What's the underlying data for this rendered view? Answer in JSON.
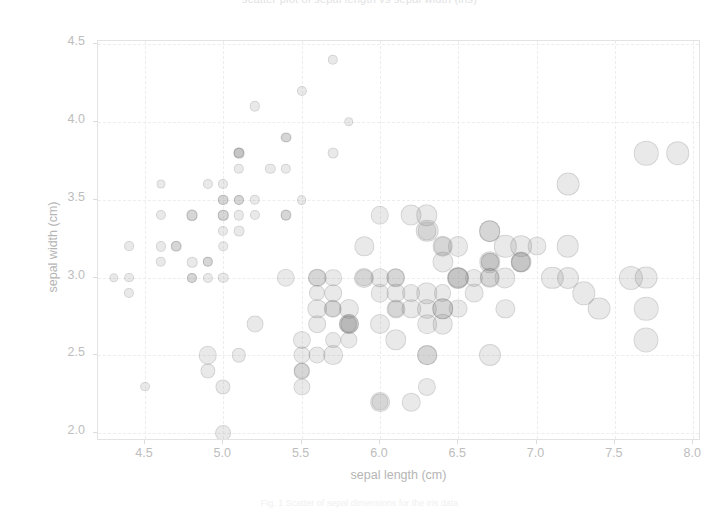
{
  "figure": {
    "title": "scatter plot of sepal length vs sepal width (iris)",
    "caption": "Fig. 1  Scatter of sepal dimensions for the iris data",
    "background": "#ffffff",
    "marker_color": "#787878",
    "grid_color": "#ededed",
    "axis_color": "#e3e3e3",
    "tick_text_color": "#bdbdbd"
  },
  "chart_data": {
    "type": "scatter",
    "title": "scatter plot of sepal length vs sepal width (iris)",
    "xlabel": "sepal length (cm)",
    "ylabel": "sepal width (cm)",
    "xlim": [
      4.2,
      8.05
    ],
    "ylim": [
      1.95,
      4.52
    ],
    "xticks": [
      4.5,
      5.0,
      5.5,
      6.0,
      6.5,
      7.0,
      7.5,
      8.0
    ],
    "yticks": [
      2.0,
      2.5,
      3.0,
      3.5,
      4.0,
      4.5
    ],
    "xtick_labels": [
      "4.5",
      "5.0",
      "5.5",
      "6.0",
      "6.5",
      "7.0",
      "7.5",
      "8.0"
    ],
    "ytick_labels": [
      "2.0",
      "2.5",
      "3.0",
      "3.5",
      "4.0",
      "4.5"
    ],
    "grid": true,
    "legend": false,
    "marker": "circle",
    "marker_alpha": 0.18,
    "size_encodes": "petal length (cm)",
    "n_points": 150,
    "points": [
      [
        5.1,
        3.5,
        1.4
      ],
      [
        4.9,
        3.0,
        1.4
      ],
      [
        4.7,
        3.2,
        1.3
      ],
      [
        4.6,
        3.1,
        1.5
      ],
      [
        5.0,
        3.6,
        1.4
      ],
      [
        5.4,
        3.9,
        1.7
      ],
      [
        4.6,
        3.4,
        1.4
      ],
      [
        5.0,
        3.4,
        1.5
      ],
      [
        4.4,
        2.9,
        1.4
      ],
      [
        4.9,
        3.1,
        1.5
      ],
      [
        5.4,
        3.7,
        1.5
      ],
      [
        4.8,
        3.4,
        1.6
      ],
      [
        4.8,
        3.0,
        1.4
      ],
      [
        4.3,
        3.0,
        1.1
      ],
      [
        5.8,
        4.0,
        1.2
      ],
      [
        5.7,
        4.4,
        1.5
      ],
      [
        5.4,
        3.9,
        1.3
      ],
      [
        5.1,
        3.5,
        1.4
      ],
      [
        5.7,
        3.8,
        1.7
      ],
      [
        5.1,
        3.8,
        1.5
      ],
      [
        5.4,
        3.4,
        1.7
      ],
      [
        5.1,
        3.7,
        1.5
      ],
      [
        4.6,
        3.6,
        1.0
      ],
      [
        5.1,
        3.3,
        1.7
      ],
      [
        4.8,
        3.4,
        1.9
      ],
      [
        5.0,
        3.0,
        1.6
      ],
      [
        5.0,
        3.4,
        1.6
      ],
      [
        5.2,
        3.5,
        1.5
      ],
      [
        5.2,
        3.4,
        1.4
      ],
      [
        4.7,
        3.2,
        1.6
      ],
      [
        4.8,
        3.1,
        1.6
      ],
      [
        5.4,
        3.4,
        1.5
      ],
      [
        5.2,
        4.1,
        1.5
      ],
      [
        5.5,
        4.2,
        1.4
      ],
      [
        4.9,
        3.1,
        1.5
      ],
      [
        5.0,
        3.2,
        1.2
      ],
      [
        5.5,
        3.5,
        1.3
      ],
      [
        4.9,
        3.6,
        1.4
      ],
      [
        4.4,
        3.0,
        1.3
      ],
      [
        5.1,
        3.4,
        1.5
      ],
      [
        5.0,
        3.5,
        1.3
      ],
      [
        4.5,
        2.3,
        1.3
      ],
      [
        4.4,
        3.2,
        1.3
      ],
      [
        5.0,
        3.5,
        1.6
      ],
      [
        5.1,
        3.8,
        1.9
      ],
      [
        4.8,
        3.0,
        1.4
      ],
      [
        5.1,
        3.8,
        1.6
      ],
      [
        4.6,
        3.2,
        1.4
      ],
      [
        5.3,
        3.7,
        1.5
      ],
      [
        5.0,
        3.3,
        1.4
      ],
      [
        7.0,
        3.2,
        4.7
      ],
      [
        6.4,
        3.2,
        4.5
      ],
      [
        6.9,
        3.1,
        4.9
      ],
      [
        5.5,
        2.3,
        4.0
      ],
      [
        6.5,
        2.8,
        4.6
      ],
      [
        5.7,
        2.8,
        4.5
      ],
      [
        6.3,
        3.3,
        4.7
      ],
      [
        4.9,
        2.4,
        3.3
      ],
      [
        6.6,
        2.9,
        4.6
      ],
      [
        5.2,
        2.7,
        3.9
      ],
      [
        5.0,
        2.0,
        3.5
      ],
      [
        5.9,
        3.0,
        4.2
      ],
      [
        6.0,
        2.2,
        4.0
      ],
      [
        6.1,
        2.9,
        4.7
      ],
      [
        5.6,
        2.9,
        3.6
      ],
      [
        6.7,
        3.1,
        4.4
      ],
      [
        5.6,
        3.0,
        4.5
      ],
      [
        5.8,
        2.7,
        4.1
      ],
      [
        6.2,
        2.2,
        4.5
      ],
      [
        5.6,
        2.5,
        3.9
      ],
      [
        5.9,
        3.2,
        4.8
      ],
      [
        6.1,
        2.8,
        4.0
      ],
      [
        6.3,
        2.5,
        4.9
      ],
      [
        6.1,
        2.8,
        4.7
      ],
      [
        6.4,
        2.9,
        4.3
      ],
      [
        6.6,
        3.0,
        4.4
      ],
      [
        6.8,
        2.8,
        4.8
      ],
      [
        6.7,
        3.0,
        5.0
      ],
      [
        6.0,
        2.9,
        4.5
      ],
      [
        5.7,
        2.6,
        3.5
      ],
      [
        5.5,
        2.4,
        3.8
      ],
      [
        5.5,
        2.4,
        3.7
      ],
      [
        5.8,
        2.7,
        3.9
      ],
      [
        6.0,
        2.7,
        5.1
      ],
      [
        5.4,
        3.0,
        4.5
      ],
      [
        6.0,
        3.4,
        4.5
      ],
      [
        6.7,
        3.1,
        4.7
      ],
      [
        6.3,
        2.3,
        4.4
      ],
      [
        5.6,
        3.0,
        4.1
      ],
      [
        5.5,
        2.5,
        4.0
      ],
      [
        5.5,
        2.6,
        4.4
      ],
      [
        6.1,
        3.0,
        4.6
      ],
      [
        5.8,
        2.6,
        4.0
      ],
      [
        5.0,
        2.3,
        3.3
      ],
      [
        5.6,
        2.7,
        4.2
      ],
      [
        5.7,
        3.0,
        4.2
      ],
      [
        5.7,
        2.9,
        4.2
      ],
      [
        6.2,
        2.9,
        4.3
      ],
      [
        5.1,
        2.5,
        3.0
      ],
      [
        5.7,
        2.8,
        4.1
      ],
      [
        6.3,
        3.3,
        6.0
      ],
      [
        5.8,
        2.7,
        5.1
      ],
      [
        7.1,
        3.0,
        5.9
      ],
      [
        6.3,
        2.9,
        5.6
      ],
      [
        6.5,
        3.0,
        5.8
      ],
      [
        7.6,
        3.0,
        6.6
      ],
      [
        4.9,
        2.5,
        4.5
      ],
      [
        7.3,
        2.9,
        6.3
      ],
      [
        6.7,
        2.5,
        5.8
      ],
      [
        7.2,
        3.6,
        6.1
      ],
      [
        6.5,
        3.2,
        5.1
      ],
      [
        6.4,
        2.7,
        5.3
      ],
      [
        6.8,
        3.0,
        5.5
      ],
      [
        5.7,
        2.5,
        5.0
      ],
      [
        5.8,
        2.8,
        5.1
      ],
      [
        6.4,
        3.2,
        5.3
      ],
      [
        6.5,
        3.0,
        5.5
      ],
      [
        7.7,
        3.8,
        6.7
      ],
      [
        7.7,
        2.6,
        6.9
      ],
      [
        6.0,
        2.2,
        5.0
      ],
      [
        6.9,
        3.2,
        5.7
      ],
      [
        5.6,
        2.8,
        4.9
      ],
      [
        7.7,
        2.8,
        6.7
      ],
      [
        6.3,
        2.7,
        4.9
      ],
      [
        6.7,
        3.3,
        5.7
      ],
      [
        7.2,
        3.2,
        6.0
      ],
      [
        6.2,
        2.8,
        4.8
      ],
      [
        6.1,
        3.0,
        4.9
      ],
      [
        6.4,
        2.8,
        5.6
      ],
      [
        7.2,
        3.0,
        5.8
      ],
      [
        7.4,
        2.8,
        6.1
      ],
      [
        7.9,
        3.8,
        6.4
      ],
      [
        6.4,
        2.8,
        5.6
      ],
      [
        6.3,
        2.8,
        5.1
      ],
      [
        6.1,
        2.6,
        5.6
      ],
      [
        7.7,
        3.0,
        6.1
      ],
      [
        6.3,
        3.4,
        5.6
      ],
      [
        6.4,
        3.1,
        5.5
      ],
      [
        6.0,
        3.0,
        4.8
      ],
      [
        6.9,
        3.1,
        5.4
      ],
      [
        6.7,
        3.1,
        5.6
      ],
      [
        6.9,
        3.1,
        5.1
      ],
      [
        5.8,
        2.7,
        5.1
      ],
      [
        6.8,
        3.2,
        5.9
      ],
      [
        6.7,
        3.3,
        5.7
      ],
      [
        6.7,
        3.0,
        5.2
      ],
      [
        6.3,
        2.5,
        5.0
      ],
      [
        6.5,
        3.0,
        5.2
      ],
      [
        6.2,
        3.4,
        5.4
      ],
      [
        5.9,
        3.0,
        5.1
      ]
    ]
  }
}
